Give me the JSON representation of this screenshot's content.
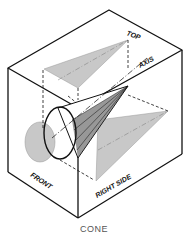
{
  "figure": {
    "labels": {
      "top": "TOP",
      "axis": "AXIS",
      "front": "FRONT",
      "right_side": "RIGHT SIDE"
    },
    "colors": {
      "line": "#111111",
      "projection_fill": "#c8c8c8",
      "background": "#ffffff"
    }
  },
  "caption": "CONE"
}
